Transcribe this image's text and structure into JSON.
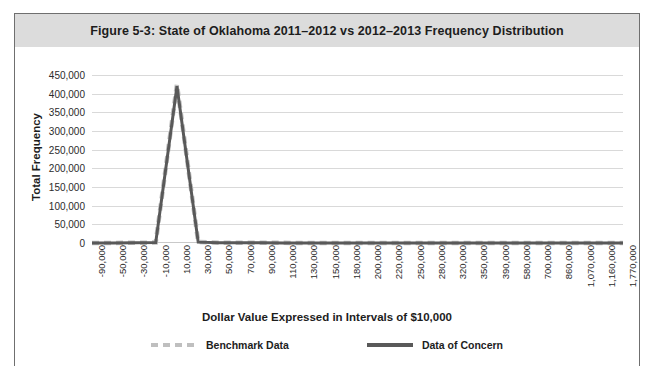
{
  "figure": {
    "title": "Figure 5-3: State of Oklahoma 2011–2012 vs 2012–2013 Frequency Distribution"
  },
  "axes": {
    "y_title": "Total Frequency",
    "x_title": "Dollar Value Expressed in Intervals of $10,000"
  },
  "legend": {
    "items": [
      {
        "label": "Benchmark Data",
        "style": "dashed",
        "color": "#bfbfbf"
      },
      {
        "label": "Data of Concern",
        "style": "solid",
        "color": "#595959"
      }
    ]
  },
  "chart_data": {
    "type": "line",
    "title": "Figure 5-3: State of Oklahoma 2011–2012 vs 2012–2013 Frequency Distribution",
    "xlabel": "Dollar Value Expressed in Intervals of $10,000",
    "ylabel": "Total Frequency",
    "grid": true,
    "legend_position": "bottom",
    "ylim": [
      0,
      450000
    ],
    "yticks": [
      0,
      50000,
      100000,
      150000,
      200000,
      250000,
      300000,
      350000,
      400000,
      450000
    ],
    "ytick_labels": [
      "0",
      "50,000",
      "100,000",
      "150,000",
      "200,000",
      "250,000",
      "300,000",
      "350,000",
      "400,000",
      "450,000"
    ],
    "categories": [
      "-90,000",
      "-50,000",
      "-30,000",
      "-10,000",
      "10,000",
      "30,000",
      "50,000",
      "70,000",
      "90,000",
      "110,000",
      "130,000",
      "150,000",
      "180,000",
      "200,000",
      "220,000",
      "250,000",
      "280,000",
      "320,000",
      "350,000",
      "390,000",
      "580,000",
      "700,000",
      "860,000",
      "1,070,000",
      "1,160,000",
      "1,770,000"
    ],
    "series": [
      {
        "name": "Benchmark Data",
        "color": "#bfbfbf",
        "style": "dashed",
        "values": [
          200,
          300,
          500,
          1200,
          425000,
          2500,
          800,
          500,
          400,
          350,
          300,
          280,
          250,
          220,
          200,
          180,
          160,
          150,
          140,
          130,
          120,
          110,
          100,
          90,
          80,
          70
        ]
      },
      {
        "name": "Data of Concern",
        "color": "#595959",
        "style": "solid",
        "values": [
          180,
          280,
          480,
          1100,
          420000,
          2300,
          750,
          480,
          380,
          330,
          290,
          270,
          240,
          210,
          190,
          170,
          155,
          145,
          135,
          125,
          115,
          105,
          95,
          85,
          75,
          65
        ]
      }
    ]
  }
}
